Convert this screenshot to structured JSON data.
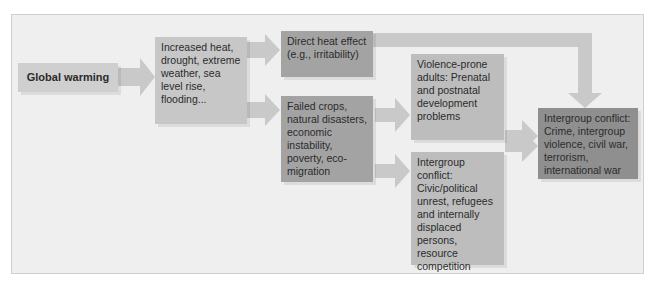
{
  "nodes": {
    "global_warming": "Global warming",
    "climate_effects": "Increased heat, drought, extreme weather, sea level rise, flooding...",
    "direct_heat": "Direct heat effect (e.g., irritability)",
    "failed_crops": "Failed crops, natural disasters, economic instability, poverty, eco-migration",
    "violence_prone": "Violence-prone adults: Prenatal and postnatal development problems",
    "intergroup_civic": "Intergroup conflict: Civic/political unrest, refugees and internally displaced persons, resource competition",
    "intergroup_final": "Intergroup conflict: Crime, intergroup violence, civil war, terrorism, international war"
  },
  "colors": {
    "panel": "#efefef",
    "arrow": "#c9c9c9",
    "light_box": "#cfcfcf",
    "mid_box": "#bdbdbd",
    "dark_box": "#a3a3a3",
    "darkest_box": "#8f8f8f"
  }
}
